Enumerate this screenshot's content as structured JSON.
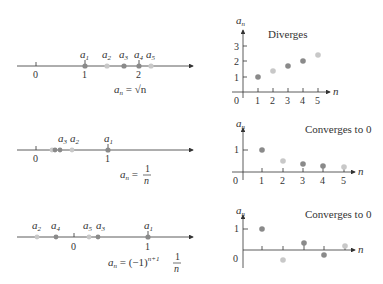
{
  "colors": {
    "axis": "#333333",
    "dot_dark": "#8a8a8a",
    "dot_light": "#c8c8c8"
  },
  "rows": [
    {
      "formula": "a_n = √n",
      "formula_lhs": "a",
      "formula_sub": "n",
      "formula_rhs": " = √n",
      "numberline": {
        "ticks": [
          "0",
          "1",
          "2"
        ],
        "labels": [
          "a1",
          "a2",
          "a3",
          "a4",
          "a5"
        ]
      },
      "plot": {
        "title": "Diverges",
        "ylabel": "a",
        "ylabel_sub": "n",
        "xlabel": "n",
        "yticks": [
          "1",
          "2",
          "3"
        ],
        "xticks": [
          "1",
          "2",
          "3",
          "4",
          "5"
        ],
        "origin": "0"
      }
    },
    {
      "formula": "a_n = 1/n",
      "formula_lhs": "a",
      "formula_sub": "n",
      "formula_eq": " = ",
      "frac_num": "1",
      "frac_den": "n",
      "numberline": {
        "ticks": [
          "0",
          "1"
        ],
        "labels": [
          "a3",
          "a2",
          "a1"
        ]
      },
      "plot": {
        "title": "Converges to 0",
        "ylabel": "a",
        "ylabel_sub": "n",
        "xlabel": "n",
        "yticks": [
          "1"
        ],
        "xticks": [
          "1",
          "2",
          "3",
          "4",
          "5"
        ],
        "origin": "0"
      }
    },
    {
      "formula": "a_n = (-1)^(n+1) 1/n",
      "formula_lhs": "a",
      "formula_sub": "n",
      "formula_eq": " = (−1)",
      "formula_sup": "n+1",
      "frac_num": "1",
      "frac_den": "n",
      "numberline": {
        "ticks": [
          "0",
          "1"
        ],
        "labels": [
          "a2",
          "a4",
          "a5",
          "a3",
          "a1"
        ]
      },
      "plot": {
        "title": "Converges to 0",
        "ylabel": "a",
        "ylabel_sub": "n",
        "xlabel": "n",
        "yticks": [
          "1"
        ],
        "origin": "0"
      }
    }
  ],
  "subscripts": {
    "s1": "1",
    "s2": "2",
    "s3": "3",
    "s4": "4",
    "s5": "5",
    "a": "a",
    "n": "n"
  }
}
